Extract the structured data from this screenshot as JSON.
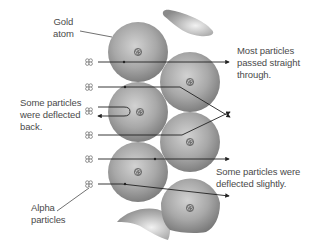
{
  "labels": {
    "gold_atom": [
      "Gold",
      "atom"
    ],
    "passed_through": [
      "Most particles",
      "passed straight",
      "through."
    ],
    "deflected_back": [
      "Some particles",
      "were deflected",
      "back."
    ],
    "deflected_slightly": [
      "Some particles were",
      "deflected slightly."
    ],
    "alpha_particles": [
      "Alpha",
      "particles"
    ]
  },
  "atoms": [
    {
      "cx": 138,
      "cy": 52,
      "r": 30
    },
    {
      "cx": 190,
      "cy": 82,
      "r": 30
    },
    {
      "cx": 138,
      "cy": 112,
      "r": 30
    },
    {
      "cx": 190,
      "cy": 142,
      "r": 30
    },
    {
      "cx": 138,
      "cy": 172,
      "r": 30
    },
    {
      "cx": 190,
      "cy": 203,
      "r": 30
    }
  ],
  "alpha_particle_rows_y": [
    62,
    87,
    111,
    135,
    159,
    184
  ],
  "colors": {
    "text": "#4a4a4a",
    "line": "#222222",
    "sphere_light": "#d8d8d8",
    "sphere_dark": "#7a7a7a"
  }
}
